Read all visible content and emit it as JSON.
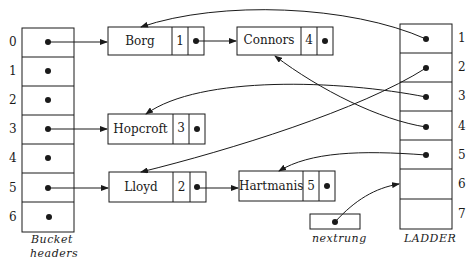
{
  "diagram": {
    "type": "hash-table-with-ladder",
    "bucket_headers": {
      "caption_line1": "Bucket",
      "caption_line2": "headers",
      "indices": [
        "0",
        "1",
        "2",
        "3",
        "4",
        "5",
        "6"
      ]
    },
    "records": [
      {
        "name": "Borg",
        "rung": "1",
        "bucket": 0
      },
      {
        "name": "Connors",
        "rung": "4",
        "bucket": 0
      },
      {
        "name": "Hopcroft",
        "rung": "3",
        "bucket": 3
      },
      {
        "name": "Lloyd",
        "rung": "2",
        "bucket": 5
      },
      {
        "name": "Hartmanis",
        "rung": "5",
        "bucket": 5
      }
    ],
    "ladder": {
      "caption": "LADDER",
      "indices": [
        "1",
        "2",
        "3",
        "4",
        "5",
        "6",
        "7"
      ],
      "pointers": {
        "1": "Borg",
        "2": "Lloyd",
        "3": "Hopcroft",
        "4": "Connors",
        "5": "Hartmanis"
      }
    },
    "nextrung": {
      "caption": "nextrung",
      "points_to": "6"
    }
  }
}
